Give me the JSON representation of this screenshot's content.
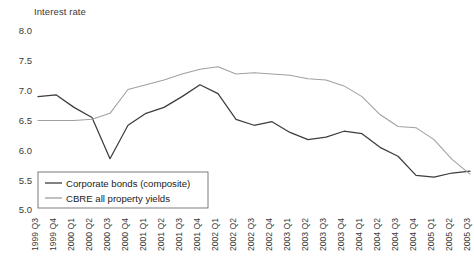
{
  "chart_data": {
    "type": "line",
    "title": "Interest rate",
    "xlabel": "",
    "ylabel": "Interest rate",
    "ylim": [
      5.0,
      8.0
    ],
    "yticks": [
      "8.0",
      "7.5",
      "7.0",
      "6.5",
      "6.0",
      "5.5",
      "5.0"
    ],
    "grid": false,
    "legend_position": "bottom-left",
    "categories": [
      "1999 Q3",
      "1999 Q4",
      "2000 Q1",
      "2000 Q2",
      "2000 Q3",
      "2000 Q4",
      "2001 Q1",
      "2001 Q2",
      "2001 Q3",
      "2001 Q4",
      "2002 Q1",
      "2002 Q2",
      "2002 Q3",
      "2002 Q4",
      "2003 Q1",
      "2003 Q2",
      "2003 Q3",
      "2003 Q4",
      "2004 Q1",
      "2004 Q2",
      "2004 Q3",
      "2004 Q4",
      "2005 Q1",
      "2005 Q2",
      "2005 Q3"
    ],
    "series": [
      {
        "name": "Corporate bonds (composite)",
        "color": "#3d3d3d",
        "values": [
          6.9,
          6.93,
          6.72,
          6.55,
          5.86,
          6.42,
          6.62,
          6.72,
          6.9,
          7.1,
          6.95,
          6.52,
          6.42,
          6.48,
          6.3,
          6.18,
          6.22,
          6.32,
          6.28,
          6.05,
          5.9,
          5.58,
          5.55,
          5.62,
          5.65
        ]
      },
      {
        "name": "CBRE all property yields",
        "color": "#a0a0a0",
        "values": [
          6.5,
          6.5,
          6.5,
          6.52,
          6.62,
          7.02,
          7.1,
          7.18,
          7.28,
          7.36,
          7.4,
          7.28,
          7.3,
          7.28,
          7.26,
          7.2,
          7.18,
          7.08,
          6.9,
          6.6,
          6.4,
          6.38,
          6.18,
          5.85,
          5.6
        ]
      }
    ]
  }
}
